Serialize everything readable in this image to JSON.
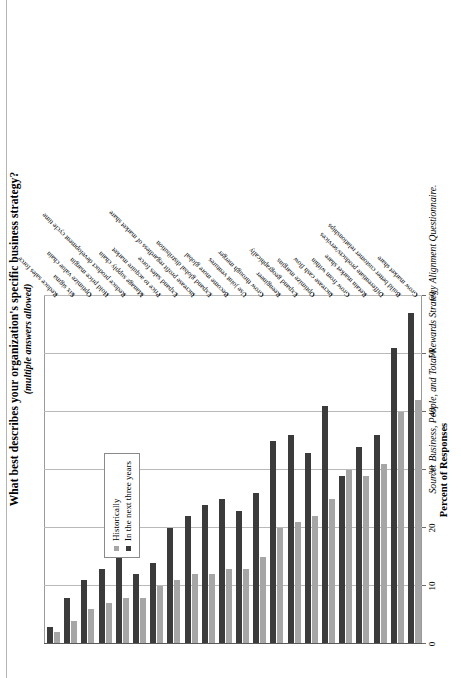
{
  "title": "What best describes your organization's specific business strategy?",
  "subtitle": "(multiple answers allowed)",
  "source": "Source: Business, People, and Total Rewards Strategy Alignment Questionnaire.",
  "legend": {
    "items": [
      {
        "label": "Historically",
        "color": "#a6a6a6"
      },
      {
        "label": "In the next three years",
        "color": "#3b3b3b"
      }
    ]
  },
  "axis": {
    "title": "Percent of Responses",
    "ticks": [
      "0",
      "10",
      "20",
      "30",
      "40",
      "50",
      "60"
    ]
  },
  "chart_data": {
    "type": "bar",
    "orientation": "horizontal",
    "title": "What best describes your organization's specific business strategy?",
    "subtitle": "(multiple answers allowed)",
    "xlabel": "Percent of Responses",
    "ylabel": "",
    "xlim": [
      0,
      60
    ],
    "grid": true,
    "legend_position": "top-left-inset",
    "categories": [
      "Grow market share",
      "Build better customer relationships",
      "Differentiate products/services",
      "Retain market share",
      "Grow from within",
      "Increase cash flow",
      "Optimize margins",
      "Expand geographically",
      "Reengineer",
      "Grow through merger",
      "Use joint ventures",
      "Become more global",
      "Expand global distribution",
      "Increase profit regardless of market share",
      "Expand sales force",
      "Price to acquire market",
      "Manage supply chain",
      "Reduce product development cycle time",
      "Hold price margin",
      "Optimize value chain",
      "Six sigma",
      "Reduce sales force"
    ],
    "series": [
      {
        "name": "Historically",
        "color": "#a6a6a6",
        "values": [
          42,
          40,
          31,
          29,
          30,
          25,
          22,
          21,
          20,
          15,
          13,
          13,
          12,
          12,
          11,
          10,
          8,
          8,
          7,
          6,
          4,
          2
        ]
      },
      {
        "name": "In the next three years",
        "color": "#3b3b3b",
        "values": [
          57,
          51,
          36,
          34,
          29,
          41,
          33,
          36,
          35,
          26,
          23,
          25,
          24,
          22,
          20,
          14,
          12,
          23,
          13,
          11,
          8,
          3
        ]
      }
    ]
  }
}
